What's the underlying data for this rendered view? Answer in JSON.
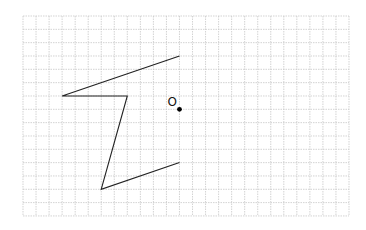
{
  "grid": {
    "origin_x": 23,
    "origin_y": 16,
    "cols": 25,
    "rows": 15,
    "cell_w": 13.04,
    "cell_h": 13.33,
    "line_color": "#c8c8c8"
  },
  "shape": {
    "stroke_color": "#222222",
    "vertices_grid": [
      [
        12,
        3
      ],
      [
        3,
        6
      ],
      [
        8,
        6
      ],
      [
        6,
        13
      ],
      [
        12,
        11
      ]
    ]
  },
  "point": {
    "label": "O",
    "grid": [
      12,
      7
    ],
    "color": "#000000"
  }
}
